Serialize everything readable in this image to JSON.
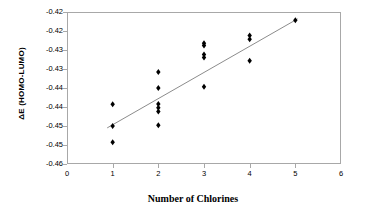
{
  "chart_data": {
    "type": "scatter",
    "title": "",
    "xlabel": "Number of Chlorines",
    "ylabel": "ΔE  (HOMO-LUMO)",
    "xlim": [
      0,
      6
    ],
    "ylim": [
      -0.46,
      -0.42
    ],
    "grid": false,
    "legend": "none",
    "x_ticks": [
      "0",
      "1",
      "2",
      "3",
      "4",
      "5",
      "6"
    ],
    "x_tick_values": [
      0,
      1,
      2,
      3,
      4,
      5,
      6
    ],
    "y_ticks": [
      "-0.42",
      "-0.42",
      "-0.43",
      "-0.43",
      "-0.44",
      "-0.44",
      "-0.45",
      "-0.45",
      "-0.46"
    ],
    "y_tick_values": [
      -0.42,
      -0.425,
      -0.43,
      -0.435,
      -0.44,
      -0.445,
      -0.45,
      -0.455,
      -0.46
    ],
    "marker": "diamond",
    "marker_color": "#000000",
    "trendline": {
      "label": "linear fit",
      "color": "#8c8c8c",
      "x": [
        0.88,
        5.05
      ],
      "y": [
        -0.4505,
        -0.4218
      ]
    },
    "points": [
      {
        "x": 1,
        "y": -0.4443
      },
      {
        "x": 1,
        "y": -0.45
      },
      {
        "x": 1,
        "y": -0.4543
      },
      {
        "x": 2,
        "y": -0.4358
      },
      {
        "x": 2,
        "y": -0.44
      },
      {
        "x": 2,
        "y": -0.4442
      },
      {
        "x": 2,
        "y": -0.4452
      },
      {
        "x": 2,
        "y": -0.4462
      },
      {
        "x": 2,
        "y": -0.4498
      },
      {
        "x": 3,
        "y": -0.4282
      },
      {
        "x": 3,
        "y": -0.4288
      },
      {
        "x": 3,
        "y": -0.4312
      },
      {
        "x": 3,
        "y": -0.432
      },
      {
        "x": 3,
        "y": -0.4397
      },
      {
        "x": 4,
        "y": -0.4262
      },
      {
        "x": 4,
        "y": -0.4272
      },
      {
        "x": 4,
        "y": -0.4328
      },
      {
        "x": 5,
        "y": -0.4222
      }
    ]
  }
}
